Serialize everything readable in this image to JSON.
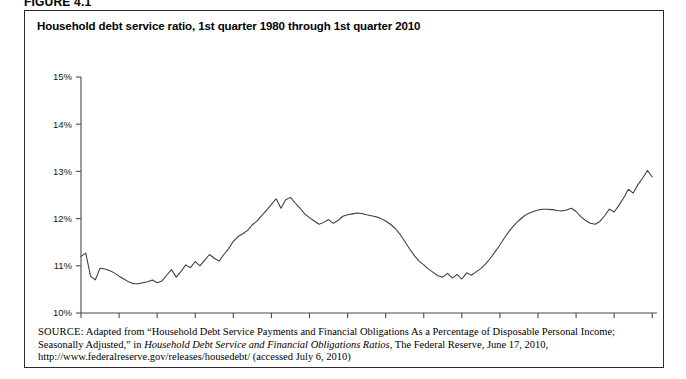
{
  "figure": {
    "label": "FIGURE 4.1",
    "title": "Household debt service ratio, 1st quarter 1980 through 1st quarter 2010"
  },
  "source": {
    "kicker": "SOURCE:",
    "line1_a": " Adapted from “Household Debt Service Payments and Financial Obligations As a Percentage of Disposable Personal Income; Seasonally Adjusted,” in ",
    "italic1": "Household Debt Service and Financial Obligations Ratios",
    "line1_b": ", The Federal Reserve, June 17, 2010, http://www.federalreserve.gov/releases/housedebt/ (accessed July 6, 2010)"
  },
  "chart_data": {
    "type": "line",
    "title": "Household debt service ratio, 1st quarter 1980 through 1st quarter 2010",
    "xlabel": "",
    "ylabel": "",
    "grid": false,
    "legend": false,
    "xlim": [
      1980,
      2010.25
    ],
    "ylim": [
      10,
      15
    ],
    "ytick_labels": [
      "10%",
      "11%",
      "12%",
      "13%",
      "14%",
      "15%"
    ],
    "ytick_values": [
      10,
      11,
      12,
      13,
      14,
      15
    ],
    "xtick_labels": [
      "1980",
      "1982",
      "1984",
      "1986",
      "1988",
      "1990",
      "1992",
      "1994",
      "1996",
      "1998",
      "2000",
      "2002",
      "2004",
      "2006",
      "2008",
      "2010"
    ],
    "xtick_values": [
      1980,
      1982,
      1984,
      1986,
      1988,
      1990,
      1992,
      1994,
      1996,
      1998,
      2000,
      2002,
      2004,
      2006,
      2008,
      2010
    ],
    "series_name": "Household debt service ratio",
    "line_color": "#3b3b3b",
    "x": [
      1980.0,
      1980.25,
      1980.5,
      1980.75,
      1981.0,
      1981.25,
      1981.5,
      1981.75,
      1982.0,
      1982.25,
      1982.5,
      1982.75,
      1983.0,
      1983.25,
      1983.5,
      1983.75,
      1984.0,
      1984.25,
      1984.5,
      1984.75,
      1985.0,
      1985.25,
      1985.5,
      1985.75,
      1986.0,
      1986.25,
      1986.5,
      1986.75,
      1987.0,
      1987.25,
      1987.5,
      1987.75,
      1988.0,
      1988.25,
      1988.5,
      1988.75,
      1989.0,
      1989.25,
      1989.5,
      1989.75,
      1990.0,
      1990.25,
      1990.5,
      1990.75,
      1991.0,
      1991.25,
      1991.5,
      1991.75,
      1992.0,
      1992.25,
      1992.5,
      1992.75,
      1993.0,
      1993.25,
      1993.5,
      1993.75,
      1994.0,
      1994.25,
      1994.5,
      1994.75,
      1995.0,
      1995.25,
      1995.5,
      1995.75,
      1996.0,
      1996.25,
      1996.5,
      1996.75,
      1997.0,
      1997.25,
      1997.5,
      1997.75,
      1998.0,
      1998.25,
      1998.5,
      1998.75,
      1999.0,
      1999.25,
      1999.5,
      1999.75,
      2000.0,
      2000.25,
      2000.5,
      2000.75,
      2001.0,
      2001.25,
      2001.5,
      2001.75,
      2002.0,
      2002.25,
      2002.5,
      2002.75,
      2003.0,
      2003.25,
      2003.5,
      2003.75,
      2004.0,
      2004.25,
      2004.5,
      2004.75,
      2005.0,
      2005.25,
      2005.5,
      2005.75,
      2006.0,
      2006.25,
      2006.5,
      2006.75,
      2007.0,
      2007.25,
      2007.5,
      2007.75,
      2008.0,
      2008.25,
      2008.5,
      2008.75,
      2009.0,
      2009.25,
      2009.5,
      2009.75,
      2010.0
    ],
    "values": [
      11.2,
      11.27,
      10.78,
      10.7,
      10.95,
      10.93,
      10.9,
      10.85,
      10.78,
      10.72,
      10.66,
      10.62,
      10.62,
      10.64,
      10.66,
      10.7,
      10.64,
      10.68,
      10.8,
      10.92,
      10.76,
      10.88,
      11.02,
      10.96,
      11.09,
      11.0,
      11.12,
      11.24,
      11.16,
      11.1,
      11.24,
      11.36,
      11.52,
      11.62,
      11.68,
      11.75,
      11.87,
      11.95,
      12.07,
      12.18,
      12.3,
      12.42,
      12.22,
      12.4,
      12.45,
      12.33,
      12.22,
      12.1,
      12.02,
      11.95,
      11.88,
      11.92,
      11.98,
      11.9,
      11.96,
      12.05,
      12.08,
      12.1,
      12.12,
      12.11,
      12.08,
      12.06,
      12.04,
      12.0,
      11.95,
      11.88,
      11.79,
      11.67,
      11.52,
      11.36,
      11.22,
      11.1,
      11.02,
      10.93,
      10.86,
      10.79,
      10.76,
      10.84,
      10.74,
      10.82,
      10.72,
      10.85,
      10.8,
      10.87,
      10.94,
      11.04,
      11.16,
      11.3,
      11.44,
      11.6,
      11.74,
      11.86,
      11.96,
      12.05,
      12.11,
      12.15,
      12.18,
      12.2,
      12.2,
      12.19,
      12.17,
      12.16,
      12.18,
      12.22,
      12.15,
      12.04,
      11.96,
      11.9,
      11.88,
      11.94,
      12.06,
      12.2,
      12.14,
      12.28,
      12.44,
      12.62,
      12.54,
      12.72,
      12.86,
      13.02,
      12.88
    ],
    "full_values_note": "Quarterly household debt service ratio, percent of disposable personal income",
    "annotations": [],
    "key_points": [
      {
        "label": "peak 1986 Q4",
        "x": 1986.75,
        "y": 12.35
      },
      {
        "label": "trough 1993 Q4",
        "x": 1993.75,
        "y": 10.78
      },
      {
        "label": "peak 2007 Q3",
        "x": 2007.5,
        "y": 13.95
      },
      {
        "label": "last 2010 Q1",
        "x": 2010.0,
        "y": 12.42
      }
    ]
  }
}
